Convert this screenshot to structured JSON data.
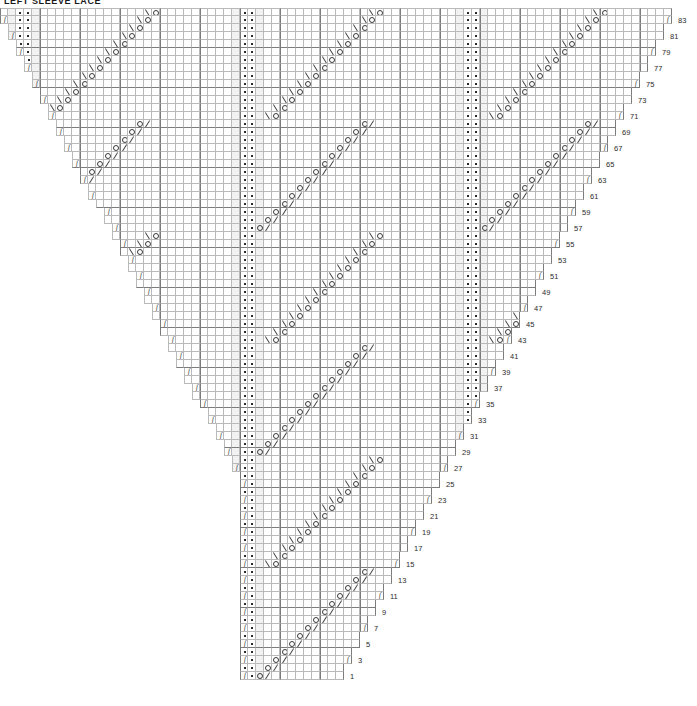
{
  "title": "LEFT SLEEVE LACE",
  "chart_data": {
    "type": "table",
    "title": "LEFT SLEEVE LACE",
    "subtitle": "",
    "xlabel": "",
    "ylabel": "",
    "grid": {
      "columns": 84,
      "rows": 84,
      "cell_px": 8,
      "major_gridline_every": 5,
      "grid_on": true
    },
    "row_numbers": {
      "side": "right",
      "interval": 2,
      "parity": "odd",
      "min": 1,
      "max": 83,
      "values": [
        83,
        81,
        79,
        77,
        75,
        73,
        71,
        69,
        67,
        65,
        63,
        61,
        59,
        57,
        55,
        53,
        51,
        49,
        47,
        45,
        43,
        41,
        39,
        37,
        35,
        33,
        31,
        29,
        27,
        25,
        23,
        21,
        19,
        17,
        15,
        13,
        11,
        9,
        7,
        5,
        3,
        1
      ]
    },
    "legend_symbols": [
      {
        "key": "dot",
        "glyph": "•",
        "name": "purl-stitch"
      },
      {
        "key": "yo",
        "glyph": "O",
        "name": "yarn-over"
      },
      {
        "key": "k2tog",
        "glyph": "/",
        "name": "knit-two-together"
      },
      {
        "key": "ssk",
        "glyph": "\\",
        "name": "slip-slip-knit"
      },
      {
        "key": "edge",
        "glyph": "ʃ",
        "name": "edge-increase"
      }
    ],
    "motif": {
      "repeat_width": 28,
      "repeat_count": 3,
      "anchor_columns_in_repeat": [
        0,
        1
      ],
      "notes": "Each 28-stitch repeat is anchored by a pair of purl-dot columns. Diagonal runs of yarn-overs paired with k2tog (upper half of repeat, leaning right) and with ssk (lower half, leaning left) form chevron lace panels between the dot columns."
    },
    "colors": {
      "background": "#ffffff",
      "gridline": "#b9b9b9",
      "gridline_major": "#7b7b7b",
      "symbol": "#3a3a3a",
      "text": "#1a1a1a",
      "shade": "#f2f2f2"
    }
  }
}
